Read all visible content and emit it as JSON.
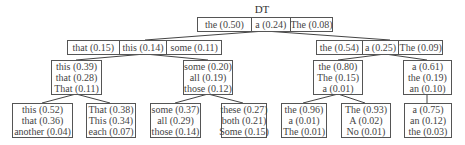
{
  "tree": {
    "root_label": "DT",
    "root": [
      "the (0.50)",
      "a (0.24)",
      "The (0.08)"
    ],
    "level1": {
      "left": [
        "that (0.15)",
        "this (0.14)",
        "some (0.11)"
      ],
      "right": [
        "the (0.54)",
        "a (0.25)",
        "The (0.09)"
      ]
    },
    "level2": [
      [
        "this (0.39)",
        "that (0.28)",
        "That (0.11)"
      ],
      [
        "some (0.20)",
        "all (0.19)",
        "those (0.12)"
      ],
      [
        "the (0.80)",
        "The (0.15)",
        "a (0.01)"
      ],
      [
        "a (0.61)",
        "the (0.19)",
        "an (0.10)"
      ]
    ],
    "level3": [
      [
        "this (0.52)",
        "that (0.36)",
        "another (0.04)"
      ],
      [
        "That (0.38)",
        "This (0.34)",
        "each (0.07)"
      ],
      [
        "some (0.37)",
        "all (0.29)",
        "those (0.14)"
      ],
      [
        "these (0.27)",
        "both (0.21)",
        "Some (0.15)"
      ],
      [
        "the (0.96)",
        "a (0.01)",
        "The (0.01)"
      ],
      [
        "The (0.93)",
        "A (0.02)",
        "No (0.01)"
      ],
      [
        "a (0.75)",
        "an (0.12)",
        "the (0.03)"
      ]
    ]
  }
}
